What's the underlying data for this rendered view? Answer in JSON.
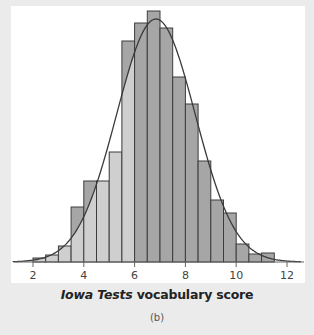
{
  "chart_data": {
    "type": "bar",
    "title": "",
    "xlabel": "Iowa Tests vocabulary score",
    "xlabel_italic_part": "Iowa Tests",
    "xlabel_rest": " vocabulary score",
    "ylabel": "",
    "caption": "(b)",
    "x_ticks": [
      2,
      4,
      6,
      8,
      10,
      12
    ],
    "xlim": [
      1.2,
      12.6
    ],
    "bin_width": 0.5,
    "bin_edges_start": [
      2.0,
      2.5,
      3.0,
      3.5,
      4.0,
      4.5,
      5.0,
      5.5,
      6.0,
      6.5,
      7.0,
      7.5,
      8.0,
      8.5,
      9.0,
      9.5,
      10.0,
      10.5,
      11.0
    ],
    "values": [
      4,
      7,
      16,
      55,
      81,
      81,
      110,
      221,
      239,
      251,
      234,
      185,
      158,
      101,
      62,
      49,
      18,
      8,
      9
    ],
    "value_units": "relative bar height (pixels, max bar = 251)",
    "overlay": {
      "type": "normal_curve",
      "mean": 6.84,
      "sd": 1.55,
      "peak_height": 243
    },
    "shading": {
      "light_region_below": 6.0,
      "dark_region_from": 6.0,
      "light_color": "#cfcfcf",
      "dark_color": "#a6a6a6"
    },
    "grid": false,
    "legend": null
  },
  "labels": {
    "xlabel_italic": "Iowa Tests",
    "xlabel_rest": " vocabulary score",
    "caption": "(b)"
  },
  "colors": {
    "background": "#ebebeb",
    "plot_bg": "#ffffff",
    "bar_light": "#cfcfcf",
    "bar_dark": "#a6a6a6",
    "bar_edge": "#3c3c3c",
    "curve": "#3a3a3a",
    "axis": "#666666"
  }
}
